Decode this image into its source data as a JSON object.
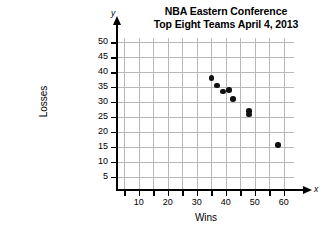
{
  "chart_data": {
    "type": "scatter",
    "title": "NBA Eastern Conference Top Eight Teams April 4, 2013",
    "title_lines": [
      "NBA Eastern Conference",
      "Top Eight Teams April 4, 2013"
    ],
    "xlabel": "Wins",
    "ylabel": "Losses",
    "x_axis_letter": "x",
    "y_axis_letter": "y",
    "xlim": [
      0,
      65
    ],
    "ylim": [
      0,
      52
    ],
    "grid": true,
    "legend": null,
    "x_ticks": [
      10,
      20,
      30,
      40,
      50,
      60
    ],
    "x_tick_labels": [
      "10",
      "20",
      "30",
      "40",
      "50",
      "60"
    ],
    "y_ticks": [
      5,
      10,
      15,
      20,
      25,
      30,
      35,
      40,
      45,
      50
    ],
    "y_tick_labels": [
      "5",
      "10",
      "15",
      "20",
      "25",
      "30",
      "35",
      "40",
      "45",
      "50"
    ],
    "x_minor_step": 5,
    "y_minor_step": 5,
    "point_color": "#111111",
    "grid_color": "#b9b9b9",
    "axis_color": "#000000",
    "points": [
      {
        "x": 35,
        "y": 38
      },
      {
        "x": 37,
        "y": 35.5
      },
      {
        "x": 39,
        "y": 33.5
      },
      {
        "x": 41,
        "y": 34
      },
      {
        "x": 42.5,
        "y": 31
      },
      {
        "x": 48,
        "y": 27
      },
      {
        "x": 48,
        "y": 25.8
      },
      {
        "x": 58,
        "y": 15.5
      }
    ]
  }
}
